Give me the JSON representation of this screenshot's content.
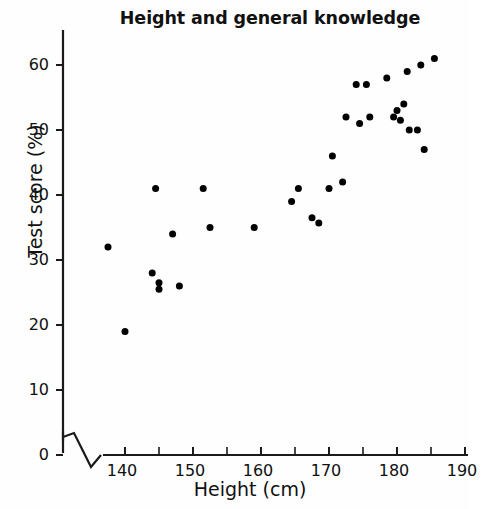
{
  "chart_data": {
    "type": "scatter",
    "title": "Height and general knowledge",
    "xlabel": "Height (cm)",
    "ylabel": "Test score (%)",
    "xlim": [
      134,
      191
    ],
    "ylim": [
      0,
      65
    ],
    "xticks": [
      140,
      150,
      160,
      170,
      180,
      190
    ],
    "yticks": [
      0,
      10,
      20,
      30,
      40,
      50,
      60
    ],
    "x_minor_tick_step": 5,
    "grid": false,
    "legend": null,
    "axis_break": "zigzag break on both axes near the origin",
    "marker": {
      "shape": "circle",
      "color": "#000000",
      "size_px": 7
    },
    "points": [
      {
        "x": 137.5,
        "y": 32
      },
      {
        "x": 140,
        "y": 19
      },
      {
        "x": 144,
        "y": 28
      },
      {
        "x": 144.5,
        "y": 41
      },
      {
        "x": 145,
        "y": 25.5
      },
      {
        "x": 145,
        "y": 26.5
      },
      {
        "x": 147,
        "y": 34
      },
      {
        "x": 148,
        "y": 26
      },
      {
        "x": 151.5,
        "y": 41
      },
      {
        "x": 152.5,
        "y": 35
      },
      {
        "x": 159,
        "y": 35
      },
      {
        "x": 164.5,
        "y": 39
      },
      {
        "x": 165.5,
        "y": 41
      },
      {
        "x": 167.5,
        "y": 36.5
      },
      {
        "x": 168.5,
        "y": 35.7
      },
      {
        "x": 170,
        "y": 41
      },
      {
        "x": 170.5,
        "y": 46
      },
      {
        "x": 172,
        "y": 42
      },
      {
        "x": 172.5,
        "y": 52
      },
      {
        "x": 174,
        "y": 57
      },
      {
        "x": 174.5,
        "y": 51
      },
      {
        "x": 175.5,
        "y": 57
      },
      {
        "x": 176,
        "y": 52
      },
      {
        "x": 178.5,
        "y": 58
      },
      {
        "x": 179.5,
        "y": 52
      },
      {
        "x": 180,
        "y": 53
      },
      {
        "x": 180.5,
        "y": 51.5
      },
      {
        "x": 181,
        "y": 54
      },
      {
        "x": 181.5,
        "y": 59
      },
      {
        "x": 181.8,
        "y": 50
      },
      {
        "x": 183,
        "y": 50
      },
      {
        "x": 183.5,
        "y": 60
      },
      {
        "x": 184,
        "y": 47
      },
      {
        "x": 185.5,
        "y": 61
      }
    ]
  },
  "axes": {
    "y_tick_labels": [
      "60",
      "50",
      "40",
      "30",
      "20",
      "10",
      "0"
    ],
    "x_tick_labels": [
      "140",
      "150",
      "160",
      "170",
      "180",
      "190"
    ]
  }
}
